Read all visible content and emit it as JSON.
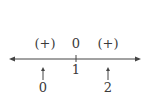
{
  "diagram": {
    "type": "sign-chart-number-line",
    "signs_above": [
      {
        "label": "(+)",
        "x": 45
      },
      {
        "label": "0",
        "x": 76
      },
      {
        "label": "(+)",
        "x": 108
      }
    ],
    "tick": {
      "label": "1",
      "x": 76
    },
    "pointers": [
      {
        "label": "0",
        "x": 43
      },
      {
        "label": "2",
        "x": 108
      }
    ],
    "colors": {
      "line": "#444444",
      "text": "#3a3a3a"
    }
  }
}
